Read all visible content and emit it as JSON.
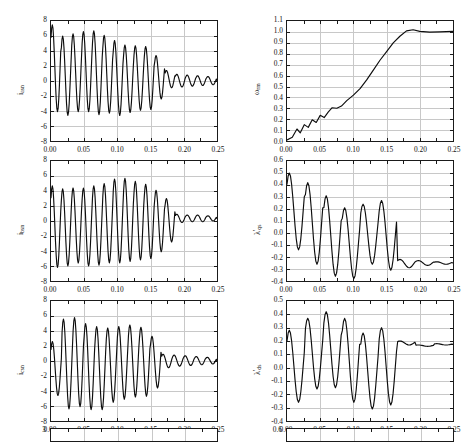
{
  "figure": {
    "title": "",
    "n_columns": 2,
    "n_visible_rows": 3,
    "partial_bottom_row": true,
    "cut_off_top_row": true
  },
  "axis": {
    "x_ticks": [
      "0.00",
      "0.05",
      "0.10",
      "0.15",
      "0.20",
      "0.25"
    ],
    "x_min": 0.0,
    "x_max": 0.25,
    "xlabel": ""
  },
  "chart_data": [
    {
      "id": "ias",
      "type": "line",
      "title": "",
      "ylabel": "i_asn",
      "ylabel_base": "i",
      "ylabel_sub": "asn",
      "xlabel": "",
      "xlim": [
        0.0,
        0.25
      ],
      "ylim": [
        -8,
        8
      ],
      "yticks": [
        "8",
        "6",
        "4",
        "2",
        "0",
        "-2",
        "-4",
        "-6",
        "-8"
      ],
      "ytick_values": [
        8,
        6,
        4,
        2,
        0,
        -2,
        -4,
        -6,
        -8
      ],
      "xticks": [
        "0.00",
        "0.05",
        "0.10",
        "0.15",
        "0.20",
        "0.25"
      ],
      "grid": true,
      "legend": "none",
      "description": "Damped oscillatory three-phase stator current, phase a, starting near 2, first peak 7.5 then decaying envelope to near 0 by 0.20 s",
      "envelope_peaks": [
        7.5,
        6.0,
        6.3,
        6.6,
        6.7,
        6.1,
        5.4,
        4.8,
        4.7,
        4.6,
        3.4,
        1.4,
        0.9,
        0.8,
        0.7,
        0.6
      ],
      "envelope_troughs": [
        -4.1,
        -4.6,
        -4.1,
        -4.1,
        -4.5,
        -4.3,
        -4.6,
        -4.2,
        -3.9,
        -3.8,
        -2.4,
        -0.9,
        -0.8,
        -0.7,
        -0.6,
        -0.5
      ]
    },
    {
      "id": "omega",
      "type": "line",
      "title": "",
      "ylabel": "omega_rm",
      "ylabel_base": "ω",
      "ylabel_sub": "rm",
      "xlabel": "",
      "xlim": [
        0.0,
        0.25
      ],
      "ylim": [
        0.0,
        1.1
      ],
      "yticks": [
        "1.1",
        "1.0",
        "0.9",
        "0.8",
        "0.7",
        "0.6",
        "0.5",
        "0.4",
        "0.3",
        "0.2",
        "0.1",
        "0.0"
      ],
      "ytick_values": [
        1.1,
        1.0,
        0.9,
        0.8,
        0.7,
        0.6,
        0.5,
        0.4,
        0.3,
        0.2,
        0.1,
        0.0
      ],
      "xticks": [
        "0.00",
        "0.05",
        "0.10",
        "0.15",
        "0.20",
        "0.25"
      ],
      "grid": true,
      "legend": "none",
      "description": "Normalized rotor mechanical speed rising from 0 with small ripples, steep ramp 0.08-0.18 s, slight overshoot to 1.02 at 0.185 s then settling at 1.0",
      "x": [
        0.0,
        0.008,
        0.015,
        0.02,
        0.026,
        0.032,
        0.038,
        0.044,
        0.05,
        0.056,
        0.062,
        0.068,
        0.075,
        0.082,
        0.09,
        0.1,
        0.11,
        0.12,
        0.13,
        0.14,
        0.15,
        0.16,
        0.17,
        0.18,
        0.19,
        0.2,
        0.215,
        0.23,
        0.25
      ],
      "y": [
        0.01,
        0.035,
        0.11,
        0.075,
        0.15,
        0.125,
        0.195,
        0.17,
        0.235,
        0.215,
        0.265,
        0.305,
        0.3,
        0.32,
        0.37,
        0.42,
        0.48,
        0.56,
        0.65,
        0.74,
        0.82,
        0.9,
        0.96,
        1.01,
        1.02,
        1.005,
        0.998,
        1.0,
        1.005
      ]
    },
    {
      "id": "ibs",
      "type": "line",
      "title": "",
      "ylabel": "i_bsn",
      "ylabel_base": "i",
      "ylabel_sub": "bsn",
      "xlabel": "",
      "xlim": [
        0.0,
        0.25
      ],
      "ylim": [
        -8,
        8
      ],
      "yticks": [
        "8",
        "6",
        "4",
        "2",
        "0",
        "-2",
        "-4",
        "-6",
        "-8"
      ],
      "ytick_values": [
        8,
        6,
        4,
        2,
        0,
        -2,
        -4,
        -6,
        -8
      ],
      "xticks": [
        "0.00",
        "0.05",
        "0.10",
        "0.15",
        "0.20",
        "0.25"
      ],
      "grid": true,
      "legend": "none",
      "description": "Damped oscillatory stator current, phase b, starting near -4 dipping to -6.2, peaks around 4.7 rising to 5.8 near 0.10 s then decaying to small ripple offset near +0.4",
      "envelope_peaks": [
        4.7,
        4.3,
        4.4,
        4.4,
        4.7,
        5.0,
        5.6,
        5.7,
        5.3,
        4.9,
        4.1,
        3.0,
        0.9,
        0.8,
        0.8,
        0.7
      ],
      "envelope_troughs": [
        -6.2,
        -6.0,
        -5.6,
        -6.0,
        -5.9,
        -5.6,
        -5.6,
        -5.4,
        -5.2,
        -5.0,
        -4.1,
        -2.8,
        -0.2,
        -0.1,
        -0.1,
        0.0
      ]
    },
    {
      "id": "lambda_qs",
      "type": "line",
      "title": "",
      "ylabel": "lambda_qs_prime",
      "ylabel_base": "λ",
      "ylabel_sub": "qs",
      "ylabel_prime": "'",
      "xlabel": "",
      "xlim": [
        0.0,
        0.25
      ],
      "ylim": [
        -0.4,
        0.6
      ],
      "yticks": [
        "0.6",
        "0.5",
        "0.4",
        "0.3",
        "0.2",
        "0.1",
        "0.0",
        "-0.1",
        "-0.2",
        "-0.3",
        "-0.4"
      ],
      "ytick_values": [
        0.6,
        0.5,
        0.4,
        0.3,
        0.2,
        0.1,
        0.0,
        -0.1,
        -0.2,
        -0.3,
        -0.4
      ],
      "xticks": [
        "0.00",
        "0.05",
        "0.10",
        "0.15",
        "0.20",
        "0.25"
      ],
      "grid": true,
      "legend": "none",
      "description": "q-axis stator flux linkage, first peak 0.50 at 0.004 s, decaying oscillation with lobes at 0.42, 0.31, 0.21, 0.24, 0.27, settling to about -0.25 after 0.17 s",
      "envelope_peaks": [
        0.5,
        0.42,
        0.31,
        0.21,
        0.24,
        0.27,
        -0.22,
        -0.23,
        -0.24
      ],
      "envelope_troughs": [
        -0.14,
        -0.26,
        -0.36,
        -0.38,
        -0.26,
        -0.31,
        -0.29,
        -0.27,
        -0.26
      ]
    },
    {
      "id": "ics",
      "type": "line",
      "title": "",
      "ylabel": "i_csn",
      "ylabel_base": "i",
      "ylabel_sub": "csn",
      "xlabel": "",
      "xlim": [
        0.0,
        0.25
      ],
      "ylim": [
        -8,
        8
      ],
      "yticks": [
        "8",
        "6",
        "4",
        "2",
        "0",
        "-2",
        "-4",
        "-6",
        "-8"
      ],
      "ytick_values": [
        8,
        6,
        4,
        2,
        0,
        -2,
        -4,
        -6,
        -8
      ],
      "xticks": [
        "0.00",
        "0.05",
        "0.10",
        "0.15",
        "0.20",
        "0.25"
      ],
      "grid": true,
      "legend": "none",
      "description": "Damped oscillatory stator current, phase c, starting near 2.5, peaks near 5.8 around 0.03-0.05 s, troughs to -6.5, decaying to near zero ripple by 0.19 s",
      "envelope_peaks": [
        2.6,
        5.6,
        5.8,
        5.0,
        4.6,
        4.4,
        4.6,
        4.8,
        4.5,
        3.3,
        0.9,
        0.8,
        0.7,
        0.6,
        0.5
      ],
      "envelope_troughs": [
        -4.6,
        -6.4,
        -6.1,
        -6.5,
        -6.5,
        -5.5,
        -5.1,
        -4.8,
        -4.7,
        -3.6,
        -0.9,
        -0.7,
        -0.6,
        -0.5,
        -0.4
      ]
    },
    {
      "id": "lambda_ds",
      "type": "line",
      "title": "",
      "ylabel": "lambda_ds_prime",
      "ylabel_base": "λ",
      "ylabel_sub": "ds",
      "ylabel_prime": "'",
      "xlabel": "",
      "xlim": [
        -0.4,
        0.5
      ],
      "ylim": [
        -0.4,
        0.5
      ],
      "yticks": [
        "0.5",
        "0.4",
        "0.3",
        "0.2",
        "0.1",
        "0.0",
        "-0.1",
        "-0.2",
        "-0.3",
        "-0.4"
      ],
      "ytick_values": [
        0.5,
        0.4,
        0.3,
        0.2,
        0.1,
        0.0,
        -0.1,
        -0.2,
        -0.3,
        -0.4
      ],
      "xticks": [
        "0.00",
        "0.05",
        "0.10",
        "0.15",
        "0.20",
        "0.25"
      ],
      "grid": true,
      "legend": "none",
      "description": "d-axis stator flux linkage, starting 0.15 peaking 0.28 then oscillating with maxima 0.37, 0.42, 0.37, 0.26, 0.30 and minima to -0.31, settling about 0.17 after 0.18 s",
      "envelope_peaks": [
        0.28,
        0.37,
        0.42,
        0.37,
        0.26,
        0.3,
        0.2,
        0.17,
        0.18
      ],
      "envelope_troughs": [
        -0.26,
        -0.16,
        -0.15,
        -0.26,
        -0.31,
        -0.28,
        0.17,
        0.16,
        0.17
      ]
    }
  ],
  "partial_row": {
    "left_ytick": "3",
    "right_ytick": "0.6"
  }
}
